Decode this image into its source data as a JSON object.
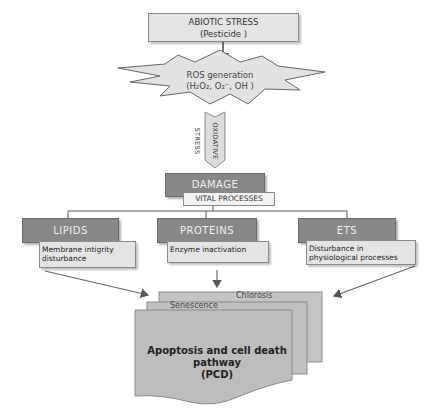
{
  "diagram": {
    "title_box": {
      "line1": "ABIOTIC STRESS",
      "line2": "(Pesticide )"
    },
    "ros": {
      "line1": "ROS generation",
      "line2": "(H₂O₂, O₂⁻, OH )"
    },
    "oxidative_stress": "OXIDATIVE STRESS",
    "damage": {
      "label": "DAMAGE",
      "sub": "VITAL PROCESSES"
    },
    "categories": [
      {
        "label": "LIPIDS",
        "effect": "Membrane intigrity disturbance"
      },
      {
        "label": "PROTEINS",
        "effect": "Enzyme inactivation"
      },
      {
        "label": "ETS",
        "effect": "Disturbance in physiological processes"
      }
    ],
    "outcomes": {
      "back": "Chlorosis",
      "middle": "Senescence",
      "front": {
        "line1": "Apoptosis and cell death",
        "line2": "pathway",
        "line3": "(PCD)"
      }
    },
    "colors": {
      "dark_box": "#888888",
      "light_box": "#e4e4e4",
      "line": "#555555",
      "stack": "#bdbdbd"
    }
  }
}
